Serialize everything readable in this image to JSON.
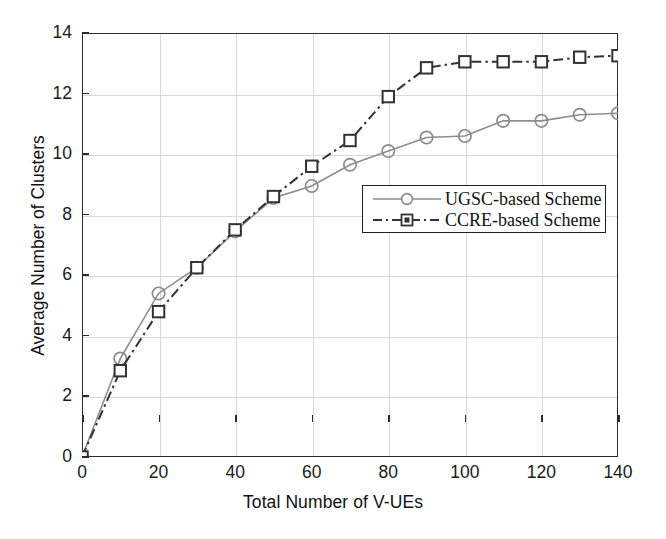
{
  "chart_data": {
    "type": "line",
    "title": "",
    "xlabel": "Total Number of V-UEs",
    "ylabel": "Average Number of Clusters",
    "xlim": [
      0,
      140
    ],
    "ylim": [
      0,
      14
    ],
    "xticks": [
      0,
      20,
      40,
      60,
      80,
      100,
      120,
      140
    ],
    "yticks": [
      0,
      2,
      4,
      6,
      8,
      10,
      12,
      14
    ],
    "grid": true,
    "legend_position": "center-right-inside",
    "x": [
      0,
      10,
      20,
      30,
      40,
      50,
      60,
      70,
      80,
      90,
      100,
      110,
      120,
      130,
      140
    ],
    "series": [
      {
        "name": "UGSC-based Scheme",
        "color": "#8c8c8c",
        "linestyle": "solid",
        "marker": "circle",
        "values": [
          0,
          3.25,
          5.4,
          6.25,
          7.45,
          8.55,
          8.95,
          9.65,
          10.1,
          10.55,
          10.6,
          11.1,
          11.1,
          11.3,
          11.35
        ]
      },
      {
        "name": "CCRE-based Scheme",
        "color": "#333333",
        "linestyle": "dashdot",
        "marker": "square",
        "values": [
          0,
          2.85,
          4.8,
          6.25,
          7.5,
          8.6,
          9.6,
          10.45,
          11.9,
          12.85,
          13.05,
          13.05,
          13.05,
          13.2,
          13.25
        ]
      }
    ]
  },
  "axes": {
    "x_tick_labels": [
      "0",
      "20",
      "40",
      "60",
      "80",
      "100",
      "120",
      "140"
    ],
    "y_tick_labels": [
      "0",
      "2",
      "4",
      "6",
      "8",
      "10",
      "12",
      "14"
    ],
    "x_title": "Total Number of V-UEs",
    "y_title": "Average Number of Clusters"
  },
  "legend": {
    "entries": [
      {
        "label": "UGSC-based Scheme"
      },
      {
        "label": "CCRE-based Scheme"
      }
    ]
  }
}
